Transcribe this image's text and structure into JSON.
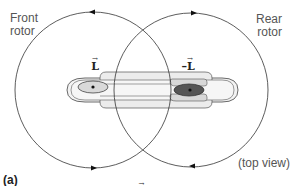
{
  "diagram": {
    "labels": {
      "front_rotor_line1": "Front",
      "front_rotor_line2": "rotor",
      "rear_rotor_line1": "Rear",
      "rear_rotor_line2": "rotor",
      "view": "(top view)",
      "panel": "(a)"
    },
    "vectors": {
      "front": "L",
      "rear": "–L",
      "arrow": "→"
    },
    "equation": {
      "sum_symbol": "Σ",
      "vector": "L",
      "rhs": " = 0"
    },
    "colors": {
      "line": "#333333",
      "fuselage_outer": "#f2f2f2",
      "fuselage_inner": "#e4e4e4",
      "front_hub": "#d9d9d9",
      "rear_hub": "#555555"
    },
    "rotation": {
      "front_rotor": "counterclockwise",
      "rear_rotor": "clockwise"
    }
  }
}
